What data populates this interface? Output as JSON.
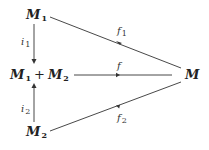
{
  "diagram": {
    "type": "commutative-diagram",
    "nodes": {
      "m1": {
        "base": "M",
        "sub": "1"
      },
      "sum": {
        "left_base": "M",
        "left_sub": "1",
        "op": "+",
        "right_base": "M",
        "right_sub": "2"
      },
      "m2": {
        "base": "M",
        "sub": "2"
      },
      "m": {
        "base": "M"
      }
    },
    "edges": {
      "i1": {
        "base": "i",
        "sub": "1",
        "from": "M1",
        "to": "M1 + M2"
      },
      "i2": {
        "base": "i",
        "sub": "2",
        "from": "M2",
        "to": "M1 + M2"
      },
      "f1": {
        "base": "f",
        "sub": "1",
        "from": "M1",
        "to": "M"
      },
      "f": {
        "base": "f",
        "sub": "",
        "from": "M1 + M2",
        "to": "M"
      },
      "f2": {
        "base": "f",
        "sub": "2",
        "from": "M2",
        "to": "M"
      }
    },
    "colors": {
      "ink": "#222222",
      "background": "#ffffff"
    }
  }
}
